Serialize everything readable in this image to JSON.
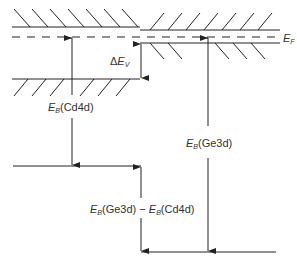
{
  "diagram": {
    "type": "energy band alignment diagram",
    "labels": {
      "fermi": {
        "sym": "E",
        "sub": "F"
      },
      "delta_ev": {
        "prefix": "Δ",
        "sym": "E",
        "sub": "V"
      },
      "eb_cd4d": {
        "sym": "E",
        "sub": "B",
        "text": "(Cd4d)"
      },
      "eb_ge3d": {
        "sym": "E",
        "sub": "B",
        "text": "(Ge3d)"
      },
      "difference": {
        "sym1": "E",
        "sub1": "B",
        "text1": "(Ge3d)",
        "minus": " − ",
        "sym2": "E",
        "sub2": "B",
        "text2": "(Cd4d)"
      }
    },
    "colors": {
      "line": "#222222",
      "text": "#333333",
      "background": "#ffffff"
    }
  }
}
